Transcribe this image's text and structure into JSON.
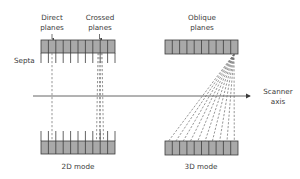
{
  "labels": {
    "direct_planes_line1": "Direct",
    "direct_planes_line2": "planes",
    "crossed_planes_line1": "Crossed",
    "crossed_planes_line2": "planes",
    "oblique_planes_line1": "Oblique",
    "oblique_planes_line2": "planes",
    "septa": "Septa",
    "scanner_axis_line1": "Scanner",
    "scanner_axis_line2": "axis",
    "mode_2d": "2D mode",
    "mode_3d": "3D mode"
  },
  "colors": {
    "detector_fill": "#a9a9a9",
    "detector_stroke": "#3c3c3c",
    "axis": "#555555",
    "dashed": "#7a7a7a",
    "text": "#3a3a3a"
  },
  "geometry": {
    "detector_cells": 10
  }
}
